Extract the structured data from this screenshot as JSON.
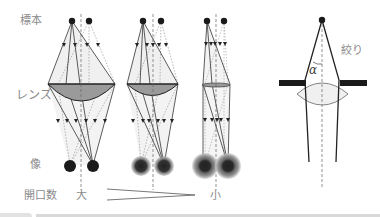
{
  "labels": {
    "specimen": "標本",
    "lens": "レンズ",
    "image": "像",
    "numerical_aperture": "開口数",
    "large": "大",
    "small": "小",
    "diaphragm": "絞り",
    "alpha": "α"
  },
  "colors": {
    "lens_fill": "#9a9a9a",
    "cone_fill": "#ececec",
    "ray": "#3a3a3a",
    "dot": "#1a1a1a",
    "label": "#8a8a8a",
    "blur": "#7a7a7a"
  },
  "diagrams": [
    {
      "name": "large-aperture",
      "lens_width": "wide",
      "image_blur": "none"
    },
    {
      "name": "medium-aperture",
      "lens_width": "medium",
      "image_blur": "small"
    },
    {
      "name": "small-aperture",
      "lens_width": "narrow",
      "image_blur": "large"
    }
  ]
}
